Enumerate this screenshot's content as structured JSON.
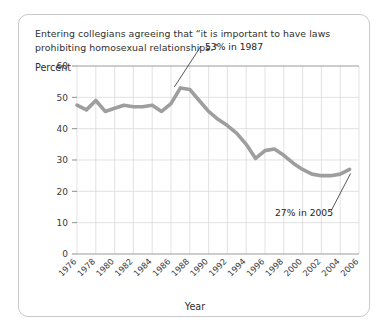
{
  "figure": {
    "caption": "Entering collegians agreeing that “it is important to have laws prohibiting homosexual relationships.”",
    "border_color": "#c9c9c9",
    "background_color": "#ffffff"
  },
  "chart_data": {
    "type": "line",
    "title": "Entering collegians agreeing that “it is important to have laws prohibiting homosexual relationships.”",
    "xlabel": "Year",
    "ylabel": "Percent",
    "ylim": [
      0,
      60
    ],
    "xlim": [
      1976,
      2006
    ],
    "ytick_labels": [
      "0",
      "10",
      "20",
      "30",
      "40",
      "50",
      "60"
    ],
    "ytick_values": [
      0,
      10,
      20,
      30,
      40,
      50,
      60
    ],
    "xtick_labels": [
      "1976",
      "1978",
      "1980",
      "1982",
      "1984",
      "1986",
      "1988",
      "1990",
      "1992",
      "1994",
      "1996",
      "1998",
      "2000",
      "2002",
      "2004",
      "2006"
    ],
    "xtick_values": [
      1976,
      1978,
      1980,
      1982,
      1984,
      1986,
      1988,
      1990,
      1992,
      1994,
      1996,
      1998,
      2000,
      2002,
      2004,
      2006
    ],
    "grid": true,
    "legend": null,
    "line_color": "#9e9e9e",
    "series": [
      {
        "name": "Percent agreeing",
        "x": [
          1976,
          1977,
          1978,
          1979,
          1980,
          1981,
          1982,
          1983,
          1984,
          1985,
          1986,
          1987,
          1988,
          1989,
          1990,
          1991,
          1992,
          1993,
          1994,
          1995,
          1996,
          1997,
          1998,
          1999,
          2000,
          2001,
          2002,
          2003,
          2004,
          2005
        ],
        "values": [
          47.5,
          46.0,
          49.0,
          45.5,
          46.5,
          47.5,
          47.0,
          47.0,
          47.5,
          45.5,
          48.0,
          53.0,
          52.5,
          49.0,
          45.5,
          43.0,
          41.0,
          38.5,
          35.0,
          30.5,
          33.0,
          33.5,
          31.5,
          29.0,
          27.0,
          25.5,
          25.0,
          25.0,
          25.5,
          27.0
        ]
      }
    ],
    "annotations": [
      {
        "text": "53% in 1987",
        "year": 1987,
        "value": 53
      },
      {
        "text": "27% in 2005",
        "year": 2005,
        "value": 27
      }
    ]
  }
}
